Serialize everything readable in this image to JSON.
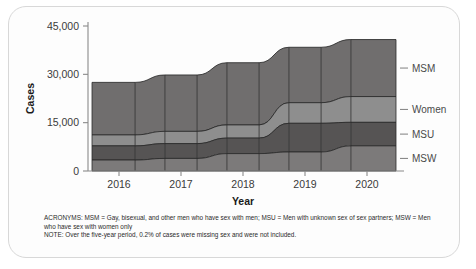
{
  "chart_data": {
    "type": "area",
    "subtype": "alluvial-stacked-area",
    "title": "",
    "xlabel": "Year",
    "ylabel": "Cases",
    "ylim": [
      0,
      45000
    ],
    "yticks": [
      0,
      15000,
      30000,
      45000
    ],
    "ytick_labels": [
      "0",
      "15,000",
      "30,000",
      "45,000"
    ],
    "categories": [
      "2016",
      "2017",
      "2018",
      "2019",
      "2020"
    ],
    "grid": false,
    "legend_position": "right",
    "series": [
      {
        "name": "MSM",
        "values": [
          16300,
          17500,
          19300,
          17200,
          17700
        ]
      },
      {
        "name": "Women",
        "values": [
          3400,
          3800,
          4100,
          6400,
          8000
        ]
      },
      {
        "name": "MSU",
        "values": [
          4400,
          4600,
          4800,
          8900,
          7300
        ]
      },
      {
        "name": "MSW",
        "values": [
          3400,
          3900,
          5400,
          5900,
          7800
        ]
      }
    ],
    "totals": [
      27500,
      29800,
      33600,
      38400,
      40800
    ],
    "stack_order_by_year": {
      "2016": [
        "MSM",
        "Women",
        "MSU",
        "MSW"
      ],
      "2017": [
        "MSM",
        "Women",
        "MSU",
        "MSW"
      ],
      "2018": [
        "MSM",
        "Women",
        "MSU",
        "MSW"
      ],
      "2019": [
        "MSM",
        "Women",
        "MSU",
        "MSW"
      ],
      "2020": [
        "MSM",
        "Women",
        "MSU",
        "MSW"
      ]
    },
    "colors": {
      "MSM": "#706e6e",
      "Women": "#8e8e8e",
      "MSU": "#565454",
      "MSW": "#7c7a7a"
    },
    "annotations": []
  },
  "axes": {
    "y_title": "Cases",
    "x_title": "Year",
    "y_tick_labels": [
      "45,000",
      "30,000",
      "15,000",
      "0"
    ],
    "x_tick_labels": [
      "2016",
      "2017",
      "2018",
      "2019",
      "2020"
    ]
  },
  "legend": {
    "items": [
      {
        "label": "MSM"
      },
      {
        "label": "Women"
      },
      {
        "label": "MSU"
      },
      {
        "label": "MSW"
      }
    ]
  },
  "footnotes": {
    "acronyms": "ACRONYMS: MSM = Gay, bisexual, and other men who have sex with men; MSU = Men with unknown sex of sex partners; MSW = Men who have sex with women only",
    "note": "NOTE: Over the five-year period, 0.2% of cases were missing sex and were not included."
  }
}
